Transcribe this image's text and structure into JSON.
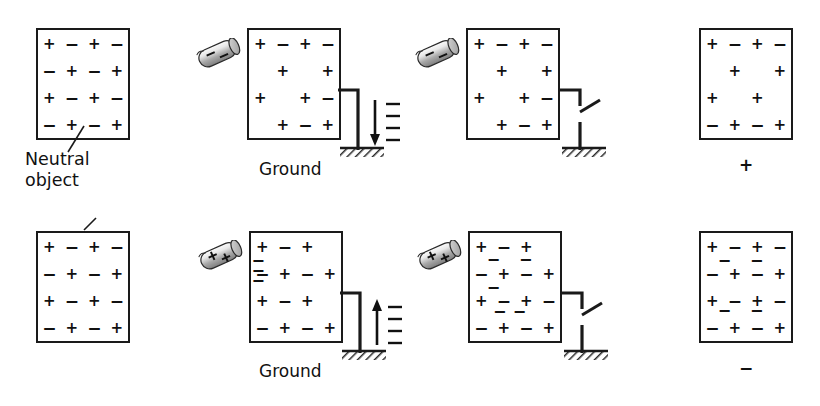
{
  "figure": {
    "stroke_color": "#1a1a1a",
    "text_color": "#111111",
    "background": "#ffffff",
    "rod_color_light": "#f2f2f2",
    "rod_color_dark": "#8c8c8c",
    "ground_hatch_color": "#2b2b2b"
  },
  "labels": {
    "neutral_object_line1": "Neutral",
    "neutral_object_line2": "object",
    "ground_top": "Ground",
    "ground_bottom": "Ground",
    "result_top": "+",
    "result_bottom": "−"
  },
  "rods": {
    "top": {
      "charge": "−",
      "signs": [
        "−",
        "−"
      ],
      "name": "negatively-charged-rod"
    },
    "bottom": {
      "charge": "+",
      "signs": [
        "+",
        "+"
      ],
      "name": "positively-charged-rod"
    }
  },
  "arrows": {
    "top": {
      "direction": "down",
      "meaning": "electrons-flow-to-ground",
      "tick_signs": [
        "−",
        "−",
        "−",
        "−"
      ]
    },
    "bottom": {
      "direction": "up",
      "meaning": "electrons-flow-from-ground",
      "tick_signs": [
        "−",
        "−",
        "−",
        "−"
      ]
    }
  },
  "panels": [
    {
      "id": "top-1",
      "row": "top",
      "step": 1,
      "name": "neutral-object-panel",
      "has_rod": false,
      "has_wire": false,
      "has_switch": false,
      "grid": [
        [
          "+",
          "−",
          "+",
          "−"
        ],
        [
          "−",
          "+",
          "−",
          "+"
        ],
        [
          "+",
          "−",
          "+",
          "−"
        ],
        [
          "−",
          "+",
          "−",
          "+"
        ]
      ],
      "extras": []
    },
    {
      "id": "top-2",
      "row": "top",
      "step": 2,
      "name": "induction-grounded-panel",
      "has_rod": true,
      "has_wire": true,
      "has_switch": false,
      "grid": [
        [
          "+",
          "−",
          "+",
          "−"
        ],
        [
          "",
          "+",
          "",
          "+"
        ],
        [
          "+",
          "",
          "+",
          "−"
        ],
        [
          "",
          "+",
          "−",
          "+"
        ]
      ],
      "extras": []
    },
    {
      "id": "top-3",
      "row": "top",
      "step": 3,
      "name": "ground-disconnected-panel",
      "has_rod": true,
      "has_wire": true,
      "has_switch": true,
      "grid": [
        [
          "+",
          "−",
          "+",
          "−"
        ],
        [
          "",
          "+",
          "",
          "+"
        ],
        [
          "+",
          "",
          "+",
          "−"
        ],
        [
          "",
          "+",
          "−",
          "+"
        ]
      ],
      "extras": []
    },
    {
      "id": "top-4",
      "row": "top",
      "step": 4,
      "name": "positively-charged-result-panel",
      "has_rod": false,
      "has_wire": false,
      "has_switch": false,
      "grid": [
        [
          "+",
          "−",
          "+",
          "−"
        ],
        [
          "",
          "+",
          "",
          "+"
        ],
        [
          "+",
          "",
          "+",
          ""
        ],
        [
          "−",
          "+",
          "−",
          "+"
        ]
      ],
      "extras": []
    },
    {
      "id": "bottom-1",
      "row": "bottom",
      "step": 1,
      "name": "neutral-object-panel",
      "has_rod": false,
      "has_wire": false,
      "has_switch": false,
      "grid": [
        [
          "+",
          "−",
          "+",
          "−"
        ],
        [
          "−",
          "+",
          "−",
          "+"
        ],
        [
          "+",
          "−",
          "+",
          "−"
        ],
        [
          "−",
          "+",
          "−",
          "+"
        ]
      ],
      "extras": []
    },
    {
      "id": "bottom-2",
      "row": "bottom",
      "step": 2,
      "name": "induction-grounded-panel",
      "has_rod": true,
      "has_wire": true,
      "has_switch": false,
      "grid": [
        [
          "+",
          "−",
          "+",
          ""
        ],
        [
          "−",
          "+",
          "−",
          "+"
        ],
        [
          "+",
          "−",
          "+",
          ""
        ],
        [
          "−",
          "+",
          "−",
          "+"
        ]
      ],
      "extras": [
        {
          "sign": "−",
          "x": 8,
          "y": 26
        },
        {
          "sign": "−",
          "x": 8,
          "y": 35
        },
        {
          "sign": "−",
          "x": 8,
          "y": 44
        }
      ]
    },
    {
      "id": "bottom-3",
      "row": "bottom",
      "step": 3,
      "name": "ground-disconnected-panel",
      "has_rod": true,
      "has_wire": true,
      "has_switch": true,
      "grid": [
        [
          "+",
          "−",
          "+",
          ""
        ],
        [
          "−",
          "+",
          "−",
          "+"
        ],
        [
          "+",
          "−",
          "+",
          "−"
        ],
        [
          "−",
          "+",
          "−",
          "+"
        ]
      ],
      "extras": [
        {
          "sign": "−",
          "x": 26,
          "y": 25
        },
        {
          "sign": "−",
          "x": 62,
          "y": 25
        },
        {
          "sign": "−",
          "x": 26,
          "y": 51
        },
        {
          "sign": "−",
          "x": 33,
          "y": 73
        },
        {
          "sign": "−",
          "x": 55,
          "y": 73
        }
      ]
    },
    {
      "id": "bottom-4",
      "row": "bottom",
      "step": 4,
      "name": "negatively-charged-result-panel",
      "has_rod": false,
      "has_wire": false,
      "has_switch": false,
      "grid": [
        [
          "+",
          "−",
          "+",
          "−"
        ],
        [
          "−",
          "+",
          "−",
          "+"
        ],
        [
          "+",
          "−",
          "+",
          "−"
        ],
        [
          "−",
          "+",
          "−",
          "+"
        ]
      ],
      "extras": [
        {
          "sign": "−",
          "x": 26,
          "y": 26
        },
        {
          "sign": "−",
          "x": 62,
          "y": 26
        },
        {
          "sign": "−",
          "x": 26,
          "y": 72
        },
        {
          "sign": "−",
          "x": 62,
          "y": 72
        }
      ]
    }
  ]
}
